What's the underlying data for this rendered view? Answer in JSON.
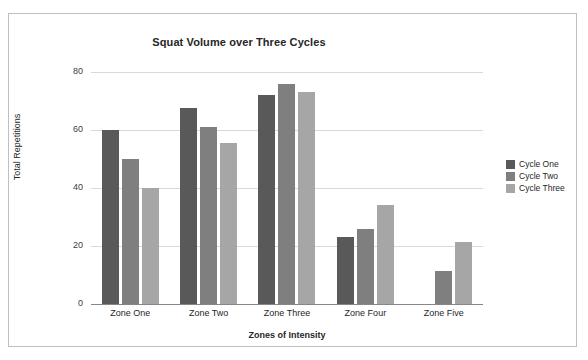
{
  "chart_data": {
    "type": "bar",
    "title": "Squat Volume over Three Cycles",
    "xlabel": "Zones of Intensity",
    "ylabel": "Total Repetitions",
    "categories": [
      "Zone One",
      "Zone Two",
      "Zone Three",
      "Zone Four",
      "Zone Five"
    ],
    "series": [
      {
        "name": "Cycle One",
        "color": "#595959",
        "values": [
          60,
          67.5,
          72,
          23,
          0
        ]
      },
      {
        "name": "Cycle Two",
        "color": "#7f7f7f",
        "values": [
          50,
          61,
          76,
          26,
          11.5
        ]
      },
      {
        "name": "Cycle Three",
        "color": "#a6a6a6",
        "values": [
          40,
          55.5,
          73,
          34,
          21.5
        ]
      }
    ],
    "ylim": [
      0,
      80
    ],
    "yticks": [
      0,
      20,
      40,
      60,
      80
    ],
    "ytick_labels": [
      "0",
      "20",
      "40",
      "60",
      "80"
    ],
    "grid": true,
    "legend_position": "right"
  }
}
